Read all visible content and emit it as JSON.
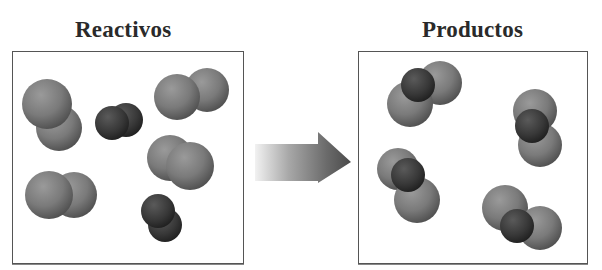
{
  "diagram": {
    "titles": {
      "reactants": "Reactivos",
      "products": "Productos"
    },
    "arrow": {
      "direction": "right",
      "label": ""
    },
    "colors": {
      "light_atom": "#7c7c7c",
      "dark_atom": "#3a3a3a",
      "border": "#555555",
      "title": "#2a2a2a"
    },
    "reactants": {
      "molecules": [
        {
          "type": "diatomic-light",
          "atoms": [
            {
              "cx": 47,
              "cy": 104,
              "r": 25,
              "shade": "light"
            },
            {
              "cx": 59,
              "cy": 128,
              "r": 23,
              "shade": "light",
              "behind": true
            }
          ]
        },
        {
          "type": "diatomic-dark",
          "atoms": [
            {
              "cx": 126,
              "cy": 120,
              "r": 17,
              "shade": "dark",
              "behind": true
            },
            {
              "cx": 112,
              "cy": 123,
              "r": 17,
              "shade": "dark"
            }
          ]
        },
        {
          "type": "diatomic-light",
          "atoms": [
            {
              "cx": 207,
              "cy": 90,
              "r": 22,
              "shade": "light",
              "behind": true
            },
            {
              "cx": 177,
              "cy": 97,
              "r": 23,
              "shade": "light"
            }
          ]
        },
        {
          "type": "diatomic-light",
          "atoms": [
            {
              "cx": 170,
              "cy": 158,
              "r": 23,
              "shade": "light",
              "behind": true
            },
            {
              "cx": 190,
              "cy": 166,
              "r": 24,
              "shade": "light"
            }
          ]
        },
        {
          "type": "diatomic-light",
          "atoms": [
            {
              "cx": 74,
              "cy": 195,
              "r": 23,
              "shade": "light",
              "behind": true
            },
            {
              "cx": 49,
              "cy": 195,
              "r": 24,
              "shade": "light"
            }
          ]
        },
        {
          "type": "diatomic-dark",
          "atoms": [
            {
              "cx": 165,
              "cy": 225,
              "r": 17,
              "shade": "dark",
              "behind": true
            },
            {
              "cx": 158,
              "cy": 211,
              "r": 17,
              "shade": "dark"
            }
          ]
        }
      ]
    },
    "products": {
      "molecules": [
        {
          "type": "triatomic",
          "atoms": [
            {
              "cx": 440,
              "cy": 83,
              "r": 22,
              "shade": "light"
            },
            {
              "cx": 410,
              "cy": 104,
              "r": 23,
              "shade": "light"
            },
            {
              "cx": 418,
              "cy": 85,
              "r": 17,
              "shade": "dark"
            }
          ]
        },
        {
          "type": "triatomic",
          "atoms": [
            {
              "cx": 540,
              "cy": 145,
              "r": 22,
              "shade": "light"
            },
            {
              "cx": 535,
              "cy": 111,
              "r": 22,
              "shade": "light"
            },
            {
              "cx": 532,
              "cy": 126,
              "r": 17,
              "shade": "dark"
            }
          ]
        },
        {
          "type": "triatomic",
          "atoms": [
            {
              "cx": 398,
              "cy": 169,
              "r": 21,
              "shade": "light"
            },
            {
              "cx": 417,
              "cy": 200,
              "r": 23,
              "shade": "light"
            },
            {
              "cx": 408,
              "cy": 175,
              "r": 17,
              "shade": "dark"
            }
          ]
        },
        {
          "type": "triatomic",
          "atoms": [
            {
              "cx": 505,
              "cy": 208,
              "r": 23,
              "shade": "light"
            },
            {
              "cx": 540,
              "cy": 228,
              "r": 22,
              "shade": "light"
            },
            {
              "cx": 517,
              "cy": 226,
              "r": 17,
              "shade": "dark"
            }
          ]
        }
      ]
    }
  }
}
